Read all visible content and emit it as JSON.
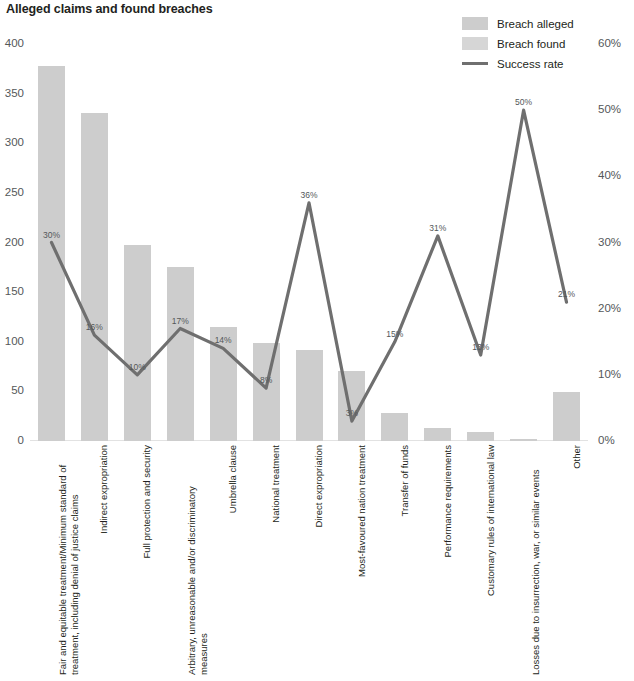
{
  "title": "Alleged claims and found breaches",
  "legend": [
    {
      "label": "Breach alleged",
      "type": "swatch",
      "color": "#cdcdcd"
    },
    {
      "label": "Breach found",
      "type": "swatch",
      "color": "#d6d6d6"
    },
    {
      "label": "Success rate",
      "type": "line",
      "color": "#6f6f6f"
    }
  ],
  "axes": {
    "left_ticks": [
      "400",
      "350",
      "300",
      "250",
      "200",
      "150",
      "100",
      "50",
      "0"
    ],
    "right_ticks": [
      "60%",
      "50%",
      "40%",
      "30%",
      "20%",
      "10%",
      "0%"
    ]
  },
  "chart_data": {
    "type": "bar",
    "title": "Alleged claims and found breaches",
    "xlabel": "",
    "ylabel": "",
    "ylim": [
      0,
      400
    ],
    "y2lim": [
      0,
      60
    ],
    "y2label": "",
    "grid": false,
    "legend_position": "top-right",
    "categories": [
      "Fair and equitable treatment/Minimum standard of treatment, including denial of justice claims",
      "Indirect expropriation",
      "Full protection and security",
      "Arbitrary, unreasonable and/or discriminatory measures",
      "Umbrella clause",
      "National treatment",
      "Direct expropriation",
      "Most-favoured nation treatment",
      "Transfer of funds",
      "Performance requirements",
      "Customary rules of international law",
      "Losses due to insurrection, war, or similar events",
      "Other"
    ],
    "series": [
      {
        "name": "Breach alleged",
        "type": "bar",
        "axis": "left",
        "color": "#cdcdcd",
        "values": [
          378,
          330,
          197,
          175,
          115,
          99,
          92,
          71,
          28,
          13,
          9,
          2,
          49
        ]
      },
      {
        "name": "Breach found",
        "type": "bar",
        "axis": "left",
        "color": "#d6d6d6",
        "values": [
          113,
          53,
          20,
          30,
          16,
          8,
          33,
          2,
          4,
          4,
          1,
          1,
          10
        ]
      },
      {
        "name": "Success rate",
        "type": "line",
        "axis": "right",
        "color": "#6f6f6f",
        "values": [
          30,
          16,
          10,
          17,
          14,
          8,
          36,
          3,
          15,
          31,
          13,
          50,
          21
        ],
        "labels": [
          "30%",
          "16%",
          "10%",
          "17%",
          "14%",
          "8%",
          "36%",
          "3%",
          "15%",
          "31%",
          "13%",
          "50%",
          "21%"
        ]
      }
    ]
  }
}
